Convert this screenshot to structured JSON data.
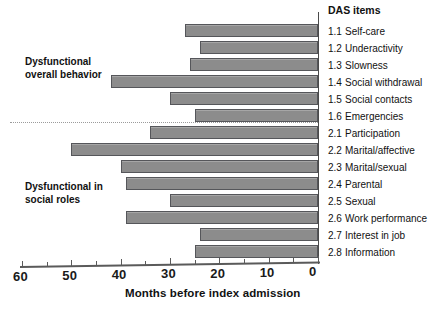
{
  "chart_data": {
    "type": "bar",
    "orientation": "horizontal",
    "title": "",
    "xlabel": "Months before index admission",
    "ylabel": "",
    "xlim": [
      60,
      0
    ],
    "x_reversed": true,
    "grid": false,
    "legend": null,
    "axis_ticks": [
      60,
      50,
      40,
      30,
      20,
      10,
      0
    ],
    "minor_tick_step": 5,
    "bar_color": "#8c8c8c",
    "bar_edge_color": "#55565a",
    "categories": [
      "1.1 Self-care",
      "1.2 Underactivity",
      "1.3 Slowness",
      "1.4 Social withdrawal",
      "1.5 Social contacts",
      "1.6 Emergencies",
      "2.1 Participation",
      "2.2 Marital/affective",
      "2.3 Marital/sexual",
      "2.4 Parental",
      "2.5 Sexual",
      "2.6 Work performance",
      "2.7 Interest in job",
      "2.8 Information"
    ],
    "values": [
      27,
      24,
      26,
      42,
      30,
      25,
      34,
      50,
      40,
      39,
      30,
      39,
      24,
      25
    ],
    "groups": [
      {
        "label": "Dysfunctional\noverall behavior",
        "items": [
          "1.1",
          "1.2",
          "1.3",
          "1.4",
          "1.5",
          "1.6"
        ]
      },
      {
        "label": "Dysfunctional in\nsocial roles",
        "items": [
          "2.1",
          "2.2",
          "2.3",
          "2.4",
          "2.5",
          "2.6",
          "2.7",
          "2.8"
        ]
      }
    ]
  },
  "labels": {
    "das_items_heading": "DAS items",
    "items": [
      {
        "code": "1.1",
        "name": "Self-care"
      },
      {
        "code": "1.2",
        "name": "Underactivity"
      },
      {
        "code": "1.3",
        "name": "Slowness"
      },
      {
        "code": "1.4",
        "name": "Social withdrawal"
      },
      {
        "code": "1.5",
        "name": "Social contacts"
      },
      {
        "code": "1.6",
        "name": "Emergencies"
      },
      {
        "code": "2.1",
        "name": "Participation"
      },
      {
        "code": "2.2",
        "name": "Marital/affective"
      },
      {
        "code": "2.3",
        "name": "Marital/sexual"
      },
      {
        "code": "2.4",
        "name": "Parental"
      },
      {
        "code": "2.5",
        "name": "Sexual"
      },
      {
        "code": "2.6",
        "name": "Work performance"
      },
      {
        "code": "2.7",
        "name": "Interest in job"
      },
      {
        "code": "2.8",
        "name": "Information"
      }
    ],
    "group_overall_line1": "Dysfunctional",
    "group_overall_line2": "overall behavior",
    "group_social_line1": "Dysfunctional in",
    "group_social_line2": "social roles",
    "x_axis_title": "Months before index admission",
    "x_tick_labels": [
      "60",
      "50",
      "40",
      "30",
      "20",
      "10",
      "0"
    ]
  }
}
